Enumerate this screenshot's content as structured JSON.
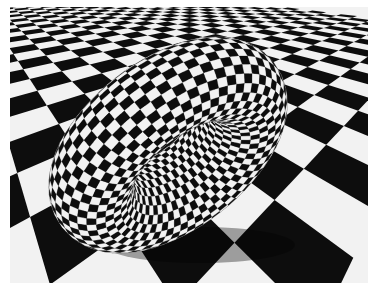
{
  "image": {
    "description": "Rendered 3D scene: black-and-white checkered torus resting at an angle on a black-and-white checkered floor in perspective",
    "frame": {
      "x": 10,
      "y": 7,
      "width": 358,
      "height": 276
    },
    "colors": {
      "border": "#ffffff",
      "dark": "#0d0d0d",
      "light": "#f2f2f2",
      "sky": "#bdbdbd"
    }
  },
  "floor": {
    "horizon_y": -60,
    "vanish_x": 120,
    "rows": 16,
    "cols": 30,
    "tile_rotation_deg": 38
  },
  "torus": {
    "center": [
      158,
      138
    ],
    "major_radius": 92,
    "minor_radius": 42,
    "tilt_x_deg": 62,
    "tilt_z_deg": -38,
    "checks_around": 64,
    "checks_tube": 28
  }
}
